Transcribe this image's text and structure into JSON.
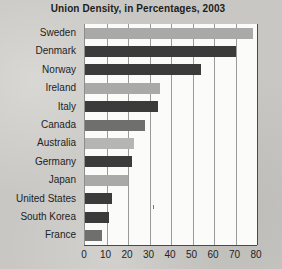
{
  "chart_data": {
    "type": "bar",
    "orientation": "horizontal",
    "title": "Union Density, in Percentages, 2003",
    "xlabel": "",
    "ylabel": "",
    "xlim": [
      0,
      80
    ],
    "xticks": [
      0,
      10,
      20,
      30,
      40,
      50,
      60,
      70,
      80
    ],
    "grid": true,
    "legend": false,
    "categories": [
      "Sweden",
      "Denmark",
      "Norway",
      "Ireland",
      "Italy",
      "Canada",
      "Australia",
      "Germany",
      "Japan",
      "United States",
      "South Korea",
      "France"
    ],
    "values": [
      78,
      70,
      54,
      35,
      34,
      28,
      23,
      22,
      20,
      12.5,
      11,
      8
    ],
    "bar_colors": [
      "#a9a9a7",
      "#3b3b3b",
      "#3b3b3b",
      "#a9a9a7",
      "#3b3b3b",
      "#6f6f6d",
      "#b5b5b3",
      "#3b3b3b",
      "#a9a9a7",
      "#3b3b3b",
      "#3b3b3b",
      "#6f6f6d"
    ],
    "colors": {
      "page_background": "#c8c7c3",
      "plot_background": "#fbfbfa",
      "gridline": "#9a9a9a",
      "axis": "#4a4a4a",
      "text": "#232323",
      "title": "#1d1d1d"
    }
  }
}
